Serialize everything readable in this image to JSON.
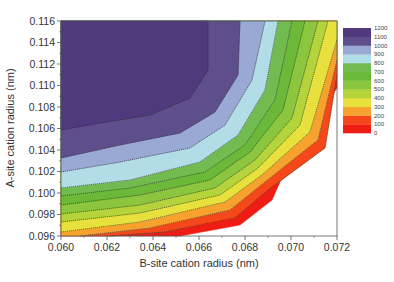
{
  "chart_data": {
    "type": "heatmap",
    "subtype": "filled-contour",
    "title": "",
    "xlabel": "B-site cation radius (nm)",
    "ylabel": "A-site cation radius (nm)",
    "xlim": [
      0.06,
      0.072
    ],
    "ylim": [
      0.096,
      0.116
    ],
    "x_ticks": [
      "0.060",
      "0.062",
      "0.064",
      "0.066",
      "0.068",
      "0.070",
      "0.072"
    ],
    "y_ticks": [
      "0.096",
      "0.098",
      "0.100",
      "0.102",
      "0.104",
      "0.106",
      "0.108",
      "0.110",
      "0.112",
      "0.114",
      "0.116"
    ],
    "grid": false,
    "legend": {
      "position": "right",
      "levels": [
        "0",
        "100",
        "200",
        "300",
        "400",
        "500",
        "600",
        "700",
        "800",
        "900",
        "1000",
        "1100",
        "1200"
      ],
      "bands": [
        {
          "range": "0-100",
          "color": "#ee1c13"
        },
        {
          "range": "100-200",
          "color": "#f4471a"
        },
        {
          "range": "200-300",
          "color": "#f7a22e"
        },
        {
          "range": "300-400",
          "color": "#e8e03c"
        },
        {
          "range": "400-500",
          "color": "#b5d43c"
        },
        {
          "range": "500-600",
          "color": "#8cc63f"
        },
        {
          "range": "600-700",
          "color": "#6cb93a"
        },
        {
          "range": "700-800",
          "color": "#72bb50"
        },
        {
          "range": "800-900",
          "color": "#b2dde6"
        },
        {
          "range": "900-1000",
          "color": "#9aa9d4"
        },
        {
          "range": "1000-1100",
          "color": "#5e4e8c"
        },
        {
          "range": "1100-1200",
          "color": "#4f3a7e"
        }
      ]
    },
    "contours_nm": [
      {
        "level": 1100,
        "points": [
          [
            0.06,
            0.1059
          ],
          [
            0.0617,
            0.1066
          ],
          [
            0.0639,
            0.1073
          ],
          [
            0.0657,
            0.1089
          ],
          [
            0.0665,
            0.1115
          ],
          [
            0.0665,
            0.116
          ]
        ]
      },
      {
        "level": 1000,
        "points": [
          [
            0.06,
            0.1033
          ],
          [
            0.0626,
            0.1045
          ],
          [
            0.0652,
            0.1056
          ],
          [
            0.0667,
            0.1076
          ],
          [
            0.0677,
            0.111
          ],
          [
            0.0678,
            0.116
          ]
        ]
      },
      {
        "level": 900,
        "points": [
          [
            0.06,
            0.102
          ],
          [
            0.0626,
            0.1029
          ],
          [
            0.0656,
            0.1042
          ],
          [
            0.0671,
            0.1064
          ],
          [
            0.0683,
            0.1106
          ],
          [
            0.0689,
            0.116
          ]
        ]
      },
      {
        "level": 800,
        "points": [
          [
            0.06,
            0.1005
          ],
          [
            0.063,
            0.1013
          ],
          [
            0.0661,
            0.1029
          ],
          [
            0.0677,
            0.1054
          ],
          [
            0.0689,
            0.1096
          ],
          [
            0.0695,
            0.116
          ]
        ]
      },
      {
        "level": 700,
        "points": [
          [
            0.06,
            0.0998
          ],
          [
            0.063,
            0.1005
          ],
          [
            0.0663,
            0.102
          ],
          [
            0.068,
            0.1045
          ],
          [
            0.0693,
            0.1087
          ],
          [
            0.0701,
            0.116
          ]
        ]
      },
      {
        "level": 600,
        "points": [
          [
            0.06,
            0.099
          ],
          [
            0.0634,
            0.0999
          ],
          [
            0.0665,
            0.1013
          ],
          [
            0.0682,
            0.1039
          ],
          [
            0.0696,
            0.1078
          ],
          [
            0.0706,
            0.116
          ]
        ]
      },
      {
        "level": 500,
        "points": [
          [
            0.06,
            0.0981
          ],
          [
            0.0634,
            0.099
          ],
          [
            0.0667,
            0.1006
          ],
          [
            0.0684,
            0.1032
          ],
          [
            0.07,
            0.1071
          ],
          [
            0.0712,
            0.116
          ]
        ]
      },
      {
        "level": 400,
        "points": [
          [
            0.06,
            0.0974
          ],
          [
            0.0634,
            0.0982
          ],
          [
            0.0669,
            0.0999
          ],
          [
            0.0685,
            0.1024
          ],
          [
            0.0703,
            0.1064
          ],
          [
            0.0716,
            0.116
          ]
        ]
      },
      {
        "level": 300,
        "points": [
          [
            0.06,
            0.0965
          ],
          [
            0.0634,
            0.0973
          ],
          [
            0.0671,
            0.0992
          ],
          [
            0.0687,
            0.1017
          ],
          [
            0.0708,
            0.1058
          ],
          [
            0.072,
            0.1142
          ]
        ]
      },
      {
        "level": 200,
        "points": [
          [
            0.0608,
            0.096
          ],
          [
            0.0639,
            0.0967
          ],
          [
            0.0673,
            0.0984
          ],
          [
            0.0688,
            0.101
          ],
          [
            0.0711,
            0.105
          ],
          [
            0.072,
            0.1124
          ]
        ]
      },
      {
        "level": 100,
        "points": [
          [
            0.0621,
            0.096
          ],
          [
            0.0645,
            0.0963
          ],
          [
            0.0676,
            0.0976
          ],
          [
            0.069,
            0.1002
          ],
          [
            0.0714,
            0.1043
          ],
          [
            0.072,
            0.111
          ]
        ]
      },
      {
        "level": 0,
        "points": [
          [
            0.0634,
            0.096
          ],
          [
            0.0652,
            0.096
          ],
          [
            0.0678,
            0.097
          ],
          [
            0.0692,
            0.0993
          ],
          [
            0.07,
            0.1035
          ],
          [
            0.072,
            0.1098
          ]
        ]
      }
    ]
  },
  "plot": {
    "left": 61,
    "top": 21,
    "right": 337,
    "bottom": 236
  },
  "polygons": [
    {
      "name": "band-0-100",
      "color": "#ee1c13",
      "points": "61,21 337,21 337,88 292,155 272,200 240,225 180,236 61,236"
    },
    {
      "name": "band-100-200",
      "color": "#f4471a",
      "points": "61,21 337,21 337,75 325,148 268,190 235,218 165,232 110,236 61,236"
    },
    {
      "name": "band-200-300",
      "color": "#f7a22e",
      "points": "61,21 337,21 337,60 318,140 265,182 230,210 150,228 80,236 61,236"
    },
    {
      "name": "band-300-400",
      "color": "#e8e03c",
      "points": "61,21 337,21 337,40 310,132 262,175 225,202 140,222 61,232"
    },
    {
      "name": "band-400-500",
      "color": "#b5d43c",
      "points": "61,21 328,21 300,125 258,168 220,195 140,213 61,222"
    },
    {
      "name": "band-500-600",
      "color": "#8cc63f",
      "points": "61,21 318,21 292,118 255,160 215,188 140,205 61,214"
    },
    {
      "name": "band-600-700",
      "color": "#6cb93a",
      "points": "61,21 305,21 283,110 250,152 210,180 140,195 61,205"
    },
    {
      "name": "band-700-800",
      "color": "#72bb50",
      "points": "61,21 292,21 275,100 245,145 205,172 130,188 61,196"
    },
    {
      "name": "band-800-900",
      "color": "#b2dde6",
      "points": "61,21 278,21 265,90 238,135 200,162 130,180 61,188"
    },
    {
      "name": "band-900-1000",
      "color": "#9aa9d4",
      "points": "61,21 265,21 252,80 225,125 190,148 120,162 61,172"
    },
    {
      "name": "band-1000-1100",
      "color": "#5e4e8c",
      "points": "61,21 240,21 238,75 215,112 180,133 120,145 61,158"
    },
    {
      "name": "band-1100-1200",
      "color": "#4f3a7e",
      "points": "61,21 208,21 208,70 190,98 150,115 100,123 61,130"
    }
  ],
  "contour_lines": [
    "61,130 100,123 150,115 190,98 208,70 208,21",
    "61,158 120,145 180,133 215,112 238,75 240,21",
    "61,172 120,162 190,148 225,125 252,80 265,21",
    "61,188 130,180 200,162 238,135 265,90 278,21",
    "61,196 130,188 205,172 245,145 275,100 292,21",
    "61,205 140,195 210,180 250,152 283,110 305,21",
    "61,214 140,205 215,188 255,160 292,118 318,21",
    "61,222 140,213 220,195 258,168 300,125 328,21",
    "61,232 140,222 225,202 262,175 310,132 337,40",
    "80,236 150,228 230,210 265,182 318,140 337,60",
    "110,236 165,232 235,218 268,190 325,148 337,75"
  ],
  "x_tick_pos": [
    61,
    107,
    153,
    199,
    245,
    291,
    337
  ],
  "y_tick_pos": [
    236,
    214.5,
    193,
    171.5,
    150,
    128.5,
    107,
    85.5,
    64,
    42.5,
    21
  ],
  "legend_box": {
    "x": 343,
    "y": 28,
    "w": 28,
    "h": 105
  }
}
